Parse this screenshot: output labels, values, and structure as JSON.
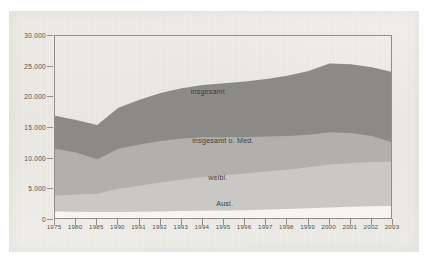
{
  "chart_data": {
    "type": "area",
    "title": "",
    "subtitle": "",
    "xlabel": "",
    "ylabel": "",
    "stacked": true,
    "grid": false,
    "legend_position": "inline-labels",
    "ylim": [
      0,
      30000
    ],
    "yticks": [
      0,
      5000,
      10000,
      15000,
      20000,
      25000,
      30000
    ],
    "ytick_labels": [
      "0",
      "5.000",
      "10.000",
      "15.000",
      "20.000",
      "25.000",
      "30.000"
    ],
    "categories": [
      "1975",
      "1980",
      "1985",
      "1990",
      "1991",
      "1992",
      "1993",
      "1994",
      "1995",
      "1996",
      "1997",
      "1998",
      "1999",
      "2000",
      "2001",
      "2002",
      "2003"
    ],
    "x": [
      1975,
      1980,
      1985,
      1990,
      1991,
      1992,
      1993,
      1994,
      1995,
      1996,
      1997,
      1998,
      1999,
      2000,
      2001,
      2002,
      2003
    ],
    "series": [
      {
        "name": "Ausl.",
        "label": "Ausl.",
        "color": "#f6f5f2",
        "stack_order": 1,
        "values": [
          1400,
          1350,
          1300,
          1300,
          1350,
          1400,
          1450,
          1500,
          1550,
          1600,
          1700,
          1800,
          1900,
          2050,
          2150,
          2250,
          2300
        ]
      },
      {
        "name": "weibl.",
        "label": "weibl.",
        "color": "#c9c8c4",
        "stack_order": 2,
        "values": [
          4000,
          4150,
          4300,
          5100,
          5600,
          6100,
          6600,
          7000,
          7300,
          7600,
          7900,
          8200,
          8600,
          9050,
          9300,
          9450,
          9500
        ]
      },
      {
        "name": "insgesamt o. Med.",
        "label": "insgesamt o. Med.",
        "color": "#b1b0ac",
        "stack_order": 3,
        "values": [
          11600,
          11000,
          9900,
          11600,
          12300,
          12900,
          13300,
          13500,
          13500,
          13500,
          13600,
          13700,
          13900,
          14300,
          14200,
          13700,
          12600
        ]
      },
      {
        "name": "insgesamt",
        "label": "insgesamt",
        "color": "#8b8a86",
        "stack_order": 4,
        "values": [
          17000,
          16300,
          15500,
          18300,
          19600,
          20700,
          21500,
          22000,
          22300,
          22600,
          23000,
          23500,
          24300,
          25500,
          25400,
          24900,
          24100
        ]
      }
    ],
    "cumulative_totals": [
      17000,
      16300,
      15500,
      18300,
      19600,
      20700,
      21500,
      22000,
      22300,
      22600,
      23000,
      23500,
      24300,
      25500,
      25400,
      24900,
      24100
    ],
    "inline_labels": [
      {
        "text": "insgesamt",
        "x_pct": 45.5,
        "y_pct": 31.0
      },
      {
        "text": "insgesamt o. Med.",
        "x_pct": 50.0,
        "y_pct": 57.5
      },
      {
        "text": "weibl.",
        "x_pct": 48.5,
        "y_pct": 77.5
      },
      {
        "text": "Ausl.",
        "x_pct": 50.5,
        "y_pct": 92.0
      }
    ]
  },
  "colors": {
    "paper_background": "#f1f0ec",
    "axis_line": "#8e8e8e",
    "text": "#53504c",
    "band_total": "#8b8a86",
    "band_total_no_med": "#b1b0ac",
    "band_female": "#c9c8c4",
    "band_foreign": "#f6f5f2"
  }
}
